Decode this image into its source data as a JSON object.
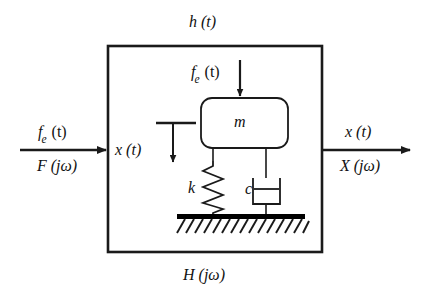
{
  "diagram": {
    "title_top": "h (t)",
    "title_bottom": "H (jω)",
    "input": {
      "time_label": "f",
      "time_sub": "e",
      "time_paren": " (t)",
      "freq_label": "F (jω)"
    },
    "output": {
      "time_label": "x (t)",
      "freq_label": "X (jω)"
    },
    "interior": {
      "displacement_label": "x (t)",
      "force_label": "f",
      "force_sub": "e",
      "force_paren": " (t)",
      "mass_label": "m",
      "spring_label": "k",
      "damper_label": "c"
    },
    "colors": {
      "stroke": "#1a1a1a",
      "ground_fill": "#000000",
      "background": "#ffffff"
    }
  }
}
